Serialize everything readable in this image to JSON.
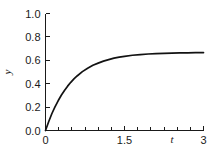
{
  "chart_data": {
    "type": "line",
    "title": "",
    "subtitle": "",
    "xlabel": "t",
    "ylabel": "y",
    "xlim": [
      0,
      3
    ],
    "ylim": [
      0.0,
      1.0
    ],
    "grid": false,
    "legend": null,
    "background_color": "#ffffff",
    "line_color": "#121212",
    "axis_color": "#1a1a1a",
    "x_tick_labels": [
      "0",
      "1.5",
      "3"
    ],
    "x_tick_values": [
      0,
      1.5,
      3
    ],
    "x_minor_tick_values": [
      0.25,
      0.5,
      0.75,
      1.0,
      1.25,
      1.75,
      2.0,
      2.25,
      2.5,
      2.75
    ],
    "y_tick_labels": [
      "0.0",
      "0.2",
      "0.4",
      "0.6",
      "0.8",
      "1.0"
    ],
    "y_tick_values": [
      0.0,
      0.2,
      0.4,
      0.6,
      0.8,
      1.0
    ],
    "asymptote": 0.667,
    "series": [
      {
        "name": "y(t)",
        "color": "#121212",
        "x": [
          0.0,
          0.06,
          0.12,
          0.18,
          0.24,
          0.3,
          0.36,
          0.42,
          0.48,
          0.54,
          0.6,
          0.7,
          0.8,
          0.9,
          1.0,
          1.1,
          1.2,
          1.3,
          1.4,
          1.5,
          1.65,
          1.8,
          1.95,
          2.1,
          2.25,
          2.4,
          2.55,
          2.7,
          2.85,
          3.0
        ],
        "y": [
          0.0,
          0.075,
          0.143,
          0.202,
          0.254,
          0.301,
          0.342,
          0.379,
          0.412,
          0.441,
          0.466,
          0.503,
          0.532,
          0.557,
          0.576,
          0.593,
          0.606,
          0.618,
          0.627,
          0.634,
          0.643,
          0.649,
          0.654,
          0.657,
          0.66,
          0.662,
          0.663,
          0.664,
          0.665,
          0.666
        ]
      }
    ]
  },
  "figure": {
    "alt_description": "Line chart of y versus t showing exponential saturation rising from the origin to a plateau near 0.67"
  }
}
